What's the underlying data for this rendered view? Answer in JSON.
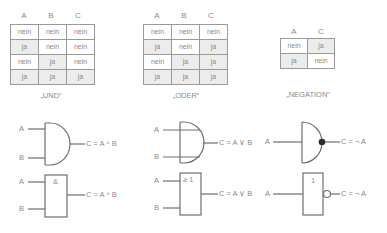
{
  "tables": [
    {
      "caption": "„UND“",
      "headers": [
        "A",
        "B",
        "C"
      ],
      "rows": [
        [
          "nein",
          "nein",
          "nein"
        ],
        [
          "ja",
          "nein",
          "nein"
        ],
        [
          "nein",
          "ja",
          "nein"
        ],
        [
          "ja",
          "ja",
          "ja"
        ]
      ]
    },
    {
      "caption": "„ODER“",
      "headers": [
        "A",
        "B",
        "C"
      ],
      "rows": [
        [
          "nein",
          "nein",
          "nein"
        ],
        [
          "ja",
          "nein",
          "ja"
        ],
        [
          "nein",
          "ja",
          "ja"
        ],
        [
          "ja",
          "ja",
          "ja"
        ]
      ]
    },
    {
      "caption": "„NEGATION“",
      "headers": [
        "A",
        "C"
      ],
      "rows": [
        [
          "nein",
          "ja"
        ],
        [
          "ja",
          "nein"
        ]
      ]
    }
  ],
  "gates": {
    "and_curved": {
      "input_a": "A",
      "input_b": "B",
      "output": "C = A ^ B"
    },
    "and_box": {
      "symbol": "&",
      "input_a": "A",
      "input_b": "B",
      "output": "C = A ^ B"
    },
    "or_curved": {
      "input_a": "A",
      "input_b": "B",
      "output": "C = A ∨ B"
    },
    "or_box": {
      "symbol": "≥ 1",
      "input_a": "A",
      "input_b": "B",
      "output": "C = A ∨ B"
    },
    "not_curved": {
      "input_a": "A",
      "output": "C = ¬ A"
    },
    "not_box": {
      "symbol": "1",
      "input_a": "A",
      "output": "C = ¬ A"
    }
  },
  "colors": {
    "line": "#6e6e6e",
    "text": "#8a8a8a",
    "shade": "#ececec"
  }
}
